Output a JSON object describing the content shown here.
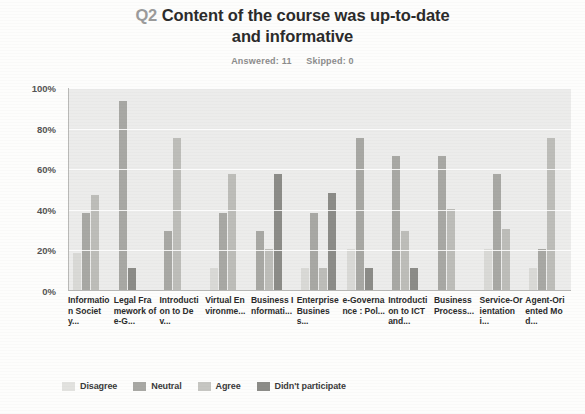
{
  "header": {
    "question_number": "Q2",
    "title_line1": "Content of the course was up-to-date",
    "title_line2": "and informative",
    "answered_label": "Answered: 11",
    "skipped_label": "Skipped: 0"
  },
  "legend": {
    "items": [
      {
        "label": "Disagree",
        "color": "#e2e2df"
      },
      {
        "label": "Neutral",
        "color": "#a8a8a4"
      },
      {
        "label": "Agree",
        "color": "#c6c6c2"
      },
      {
        "label": "Didn't participate",
        "color": "#8c8c88"
      }
    ]
  },
  "axis": {
    "yticks": [
      "100%",
      "80%",
      "60%",
      "40%",
      "20%",
      "0%"
    ]
  },
  "chart_data": {
    "type": "bar",
    "title": "Q2 Content of the course was up-to-date and informative",
    "subtitle": "Answered: 11   Skipped: 0",
    "xlabel": "",
    "ylabel": "",
    "ylim": [
      0,
      100
    ],
    "ytick_values": [
      0,
      20,
      40,
      60,
      80,
      100
    ],
    "grid": true,
    "legend_position": "bottom",
    "categories": [
      "Information Societ y...",
      "Legal Framework of e-G...",
      "Introduction to Dev...",
      "Virtual Environme...",
      "Business Informati...",
      "Enterprise Business...",
      "e-Governance : Pol...",
      "Introduction to ICT and...",
      "Business Process...",
      "Service-Orientation i...",
      "Agent-Oriented Mod..."
    ],
    "series": [
      {
        "name": "Disagree",
        "values": [
          18,
          0,
          0,
          11,
          0,
          11,
          20,
          0,
          0,
          20,
          11
        ]
      },
      {
        "name": "Neutral",
        "values": [
          38,
          93,
          29,
          38,
          29,
          38,
          75,
          66,
          66,
          57,
          20
        ]
      },
      {
        "name": "Agree",
        "values": [
          47,
          0,
          75,
          57,
          20,
          11,
          0,
          29,
          40,
          30,
          75
        ]
      },
      {
        "name": "Didn't participate",
        "values": [
          0,
          11,
          0,
          0,
          57,
          48,
          11,
          11,
          0,
          0,
          0
        ]
      }
    ]
  }
}
